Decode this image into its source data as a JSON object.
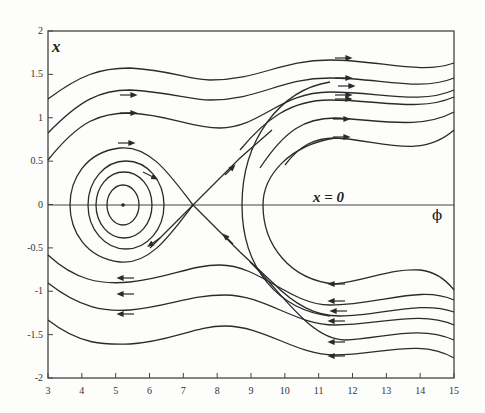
{
  "chart_data": {
    "type": "phase-portrait",
    "xlabel": "ϕ",
    "ylabel": "x",
    "xlim": [
      3,
      15
    ],
    "ylim": [
      -2,
      2
    ],
    "xticks": [
      "3",
      "4",
      "5",
      "6",
      "7",
      "8",
      "9",
      "10",
      "11",
      "12",
      "13",
      "14",
      "15"
    ],
    "yticks": [
      "2",
      "1.5",
      "1",
      "0.5",
      "0",
      "-0.5",
      "-1",
      "-1.5",
      "-2"
    ],
    "annotation": "x = 0",
    "center": {
      "phi": 5.2,
      "x": 0
    },
    "saddle": {
      "phi": 7.3,
      "x": 0
    },
    "closed_orbits_radii": [
      0.25,
      0.45,
      0.7
    ],
    "upper_flow_curves_x_at_left": [
      0.8,
      0.5,
      0.0
    ],
    "lower_flow_curves_x_at_left": [
      -0.6,
      -1.0
    ],
    "right_c_curves_vertex_phi": [
      8.7,
      9.35
    ]
  },
  "colors": {
    "curve": "#2a2a2a",
    "axis": "#444444",
    "background": "#fdfdfb"
  }
}
